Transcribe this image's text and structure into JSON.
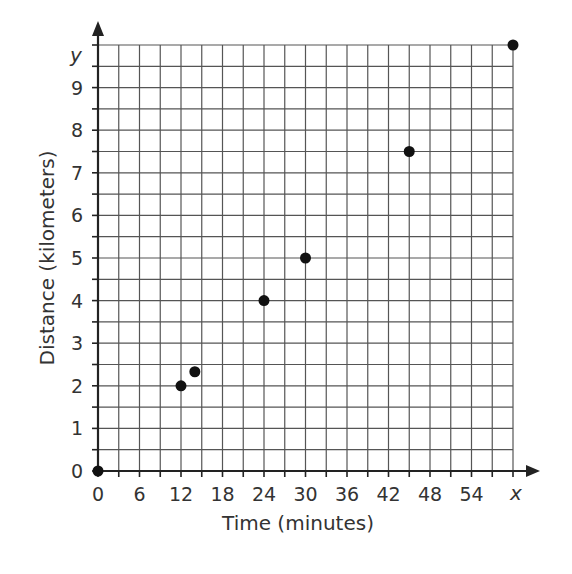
{
  "chart_data": {
    "type": "scatter",
    "title": "",
    "xlabel": "Time (minutes)",
    "ylabel": "Distance (kilometers)",
    "x_axis_var": "x",
    "y_axis_var": "y",
    "xlim": [
      0,
      60
    ],
    "ylim": [
      0,
      10
    ],
    "x_ticks": [
      0,
      6,
      12,
      18,
      24,
      30,
      36,
      42,
      48,
      54
    ],
    "y_ticks": [
      0,
      1,
      2,
      3,
      4,
      5,
      6,
      7,
      8,
      9
    ],
    "x_minor_step": 3,
    "y_minor_step": 0.5,
    "grid": true,
    "legend": "none",
    "series": [
      {
        "name": "Distance vs Time",
        "points": [
          {
            "x": 0,
            "y": 0
          },
          {
            "x": 12,
            "y": 2
          },
          {
            "x": 14,
            "y": 2.33
          },
          {
            "x": 24,
            "y": 4
          },
          {
            "x": 30,
            "y": 5
          },
          {
            "x": 45,
            "y": 7.5
          },
          {
            "x": 60,
            "y": 10
          }
        ]
      }
    ],
    "colors": {
      "point": "#111111",
      "grid": "#555555",
      "axis": "#222222",
      "text": "#333333"
    }
  }
}
